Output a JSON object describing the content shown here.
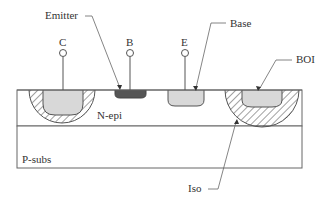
{
  "diagram": {
    "terminals": [
      {
        "id": "collector",
        "label": "C"
      },
      {
        "id": "base",
        "label": "B"
      },
      {
        "id": "emitter",
        "label": "E"
      }
    ],
    "callouts": {
      "emitter": "Emitter",
      "base": "Base",
      "boi": "BOI",
      "iso": "Iso"
    },
    "regions": {
      "epi": "N-epi",
      "substrate": "P-subs"
    },
    "colors": {
      "outline": "#555555",
      "light_fill": "#d8d8d8",
      "dark_fill": "#555555",
      "hatch": "#444444"
    }
  }
}
